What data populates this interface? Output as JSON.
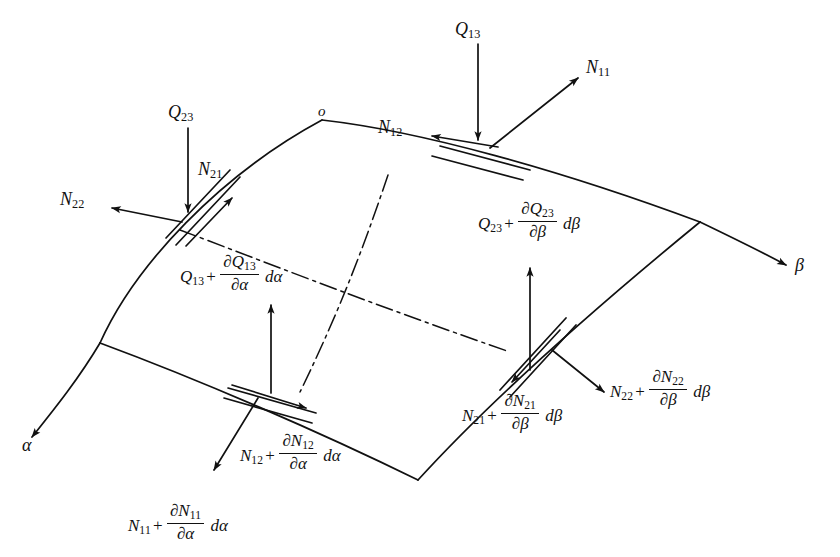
{
  "figure": {
    "type": "engineering-diagram",
    "background_color": "#ffffff",
    "stroke_color": "#111111"
  },
  "origin": {
    "label": "o"
  },
  "axes": [
    {
      "name": "alpha-axis",
      "label": "α",
      "direction": "lower-left"
    },
    {
      "name": "beta-axis",
      "label": "β",
      "direction": "lower-right"
    }
  ],
  "labels": {
    "Q23": {
      "base": "Q",
      "sub": "23"
    },
    "Q13": {
      "base": "Q",
      "sub": "13"
    },
    "N11": {
      "base": "N",
      "sub": "11"
    },
    "N12": {
      "base": "N",
      "sub": "12"
    },
    "N21": {
      "base": "N",
      "sub": "21"
    },
    "N22": {
      "base": "N",
      "sub": "22"
    }
  },
  "expressions": {
    "Q13_alpha": {
      "name": "Q13-plus-partial-alpha",
      "base": "Q",
      "base_sub": "13",
      "plus": "+",
      "num_base": "∂Q",
      "num_sub": "13",
      "den": "∂α",
      "diff": "dα"
    },
    "Q23_beta": {
      "name": "Q23-plus-partial-beta",
      "base": "Q",
      "base_sub": "23",
      "plus": "+",
      "num_base": "∂Q",
      "num_sub": "23",
      "den": "∂β",
      "diff": "dβ"
    },
    "N11_alpha": {
      "name": "N11-plus-partial-alpha",
      "base": "N",
      "base_sub": "11",
      "plus": "+",
      "num_base": "∂N",
      "num_sub": "11",
      "den": "∂α",
      "diff": "dα"
    },
    "N12_alpha": {
      "name": "N12-plus-partial-alpha",
      "base": "N",
      "base_sub": "12",
      "plus": "+",
      "num_base": "∂N",
      "num_sub": "12",
      "den": "∂α",
      "diff": "dα"
    },
    "N21_beta": {
      "name": "N21-plus-partial-beta",
      "base": "N",
      "base_sub": "21",
      "plus": "+",
      "num_base": "∂N",
      "num_sub": "21",
      "den": "∂β",
      "diff": "dβ"
    },
    "N22_beta": {
      "name": "N22-plus-partial-beta",
      "base": "N",
      "base_sub": "22",
      "plus": "+",
      "num_base": "∂N",
      "num_sub": "22",
      "den": "∂β",
      "diff": "dβ"
    }
  }
}
